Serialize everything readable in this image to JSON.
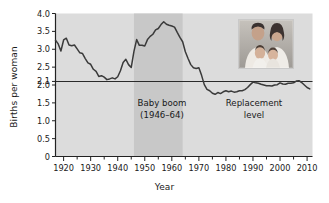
{
  "chart_data": {
    "type": "line",
    "title": "",
    "xlabel": "Year",
    "ylabel": "Births per woman",
    "xlim": [
      1917,
      2012
    ],
    "ylim": [
      0,
      4.0
    ],
    "grid": false,
    "legend": "none",
    "yticks": [
      0,
      0.5,
      1.0,
      1.5,
      2.0,
      2.1,
      2.5,
      3.0,
      3.5,
      4.0
    ],
    "ytick_labels": [
      "0",
      "0.5",
      "1.0",
      "1.5",
      "2.0",
      "2.1",
      "2.5",
      "3.0",
      "3.5",
      "4.0"
    ],
    "xticks": [
      1920,
      1930,
      1940,
      1950,
      1960,
      1970,
      1980,
      1990,
      2000,
      2010
    ],
    "xtick_labels": [
      "1920",
      "1930",
      "1940",
      "1950",
      "1960",
      "1970",
      "1980",
      "1990",
      "2000",
      "2010"
    ],
    "minor_xticks": [
      1925,
      1935,
      1945,
      1955,
      1965,
      1975,
      1985,
      1995,
      2005
    ],
    "reference_lines": [
      {
        "name": "replacement-level",
        "y": 2.1,
        "label": "Replacement level",
        "color": "#2a2a2a"
      }
    ],
    "shaded_bands": [
      {
        "name": "baby-boom-band",
        "x0": 1946,
        "x1": 1964,
        "color": "#c8c8c8",
        "label": "Baby boom (1946–64)"
      }
    ],
    "plot_background": "#dcdcdc",
    "line_color": "#3a3a3a",
    "series": [
      {
        "name": "Total fertility rate",
        "x": [
          1917,
          1918,
          1919,
          1920,
          1921,
          1922,
          1923,
          1924,
          1925,
          1926,
          1927,
          1928,
          1929,
          1930,
          1931,
          1932,
          1933,
          1934,
          1935,
          1936,
          1937,
          1938,
          1939,
          1940,
          1941,
          1942,
          1943,
          1944,
          1945,
          1946,
          1947,
          1948,
          1949,
          1950,
          1951,
          1952,
          1953,
          1954,
          1955,
          1956,
          1957,
          1958,
          1959,
          1960,
          1961,
          1962,
          1963,
          1964,
          1965,
          1966,
          1967,
          1968,
          1969,
          1970,
          1971,
          1972,
          1973,
          1974,
          1975,
          1976,
          1977,
          1978,
          1979,
          1980,
          1981,
          1982,
          1983,
          1984,
          1985,
          1986,
          1987,
          1988,
          1989,
          1990,
          1991,
          1992,
          1993,
          1994,
          1995,
          1996,
          1997,
          1998,
          1999,
          2000,
          2001,
          2002,
          2003,
          2004,
          2005,
          2006,
          2007,
          2008,
          2009,
          2010,
          2011
        ],
        "y": [
          3.25,
          3.15,
          2.95,
          3.26,
          3.31,
          3.12,
          3.1,
          3.12,
          3.01,
          2.9,
          2.88,
          2.74,
          2.62,
          2.58,
          2.44,
          2.38,
          2.24,
          2.26,
          2.22,
          2.15,
          2.17,
          2.2,
          2.17,
          2.23,
          2.4,
          2.63,
          2.72,
          2.57,
          2.49,
          2.94,
          3.27,
          3.11,
          3.11,
          3.09,
          3.27,
          3.36,
          3.42,
          3.54,
          3.58,
          3.69,
          3.77,
          3.7,
          3.67,
          3.65,
          3.62,
          3.47,
          3.33,
          3.21,
          2.93,
          2.74,
          2.57,
          2.48,
          2.46,
          2.48,
          2.27,
          2.01,
          1.88,
          1.84,
          1.77,
          1.74,
          1.79,
          1.76,
          1.81,
          1.84,
          1.81,
          1.83,
          1.8,
          1.81,
          1.84,
          1.84,
          1.87,
          1.93,
          2.01,
          2.08,
          2.06,
          2.05,
          2.02,
          2.0,
          1.98,
          1.98,
          1.97,
          2.0,
          2.01,
          2.06,
          2.03,
          2.02,
          2.05,
          2.05,
          2.06,
          2.11,
          2.12,
          2.07,
          2.0,
          1.93,
          1.89
        ]
      }
    ],
    "annotations": [
      {
        "name": "baby-boom-annotation",
        "line1": "Baby boom",
        "line2": "(1946–64)"
      },
      {
        "name": "replacement-level-annotation",
        "line1": "Replacement",
        "line2": "level"
      }
    ],
    "inset_image": {
      "name": "family-photo",
      "alt": "Family photo: two parents with two young children"
    }
  }
}
